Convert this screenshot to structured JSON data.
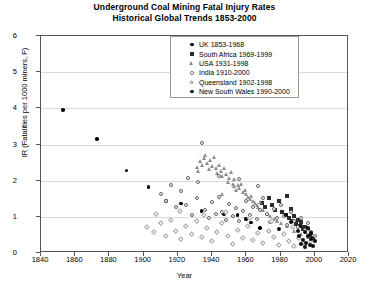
{
  "chart_data": {
    "type": "scatter",
    "title": "Underground Coal Mining Fatal Injury Rates",
    "subtitle": "Historical Global Trends 1853-2000",
    "xlabel": "Year",
    "ylabel": "IR (Fatalities per 1000 miners, F)",
    "xlim": [
      1840,
      2020
    ],
    "ylim": [
      0,
      6
    ],
    "xticks": [
      1840,
      1860,
      1880,
      1900,
      1920,
      1940,
      1960,
      1980,
      2000,
      2020
    ],
    "yticks": [
      0,
      1,
      2,
      3,
      4,
      5,
      6
    ],
    "grid": "horizontal",
    "legend_position": "top-center",
    "series": [
      {
        "name": "UK 1853-1968",
        "marker": "filled-circle",
        "marker_class": "uk",
        "color": "#000000",
        "points": [
          [
            1853,
            3.95
          ],
          [
            1873,
            3.15
          ],
          [
            1890,
            2.27
          ],
          [
            1903,
            1.82
          ],
          [
            1913,
            1.43
          ],
          [
            1922,
            1.36
          ],
          [
            1934,
            1.16
          ],
          [
            1947,
            1.07
          ],
          [
            1955,
            1.04
          ],
          [
            1960,
            0.93
          ],
          [
            1963,
            0.84
          ],
          [
            1968,
            0.68
          ]
        ]
      },
      {
        "name": "South Africa 1969-1999",
        "marker": "filled-square",
        "marker_class": "sa",
        "color": "#2b2b2b",
        "points": [
          [
            1969,
            1.38
          ],
          [
            1971,
            1.26
          ],
          [
            1973,
            1.52
          ],
          [
            1975,
            1.33
          ],
          [
            1977,
            1.18
          ],
          [
            1979,
            1.44
          ],
          [
            1981,
            1.12
          ],
          [
            1983,
            1.05
          ],
          [
            1984,
            1.58
          ],
          [
            1985,
            0.97
          ],
          [
            1986,
            1.21
          ],
          [
            1987,
            0.88
          ],
          [
            1988,
            1.02
          ],
          [
            1989,
            0.79
          ],
          [
            1990,
            0.92
          ],
          [
            1991,
            0.74
          ],
          [
            1992,
            0.86
          ],
          [
            1993,
            0.66
          ],
          [
            1994,
            0.71
          ],
          [
            1995,
            0.58
          ],
          [
            1996,
            0.63
          ],
          [
            1997,
            0.49
          ],
          [
            1998,
            0.55
          ],
          [
            1999,
            0.42
          ]
        ]
      },
      {
        "name": "USA 1931-1998",
        "marker": "triangle",
        "marker_class": "usa",
        "color": "#8d8d8d",
        "points": [
          [
            1931,
            2.38
          ],
          [
            1932,
            2.26
          ],
          [
            1933,
            2.55
          ],
          [
            1934,
            2.44
          ],
          [
            1935,
            2.62
          ],
          [
            1936,
            2.71
          ],
          [
            1937,
            2.49
          ],
          [
            1938,
            2.32
          ],
          [
            1939,
            2.58
          ],
          [
            1940,
            2.41
          ],
          [
            1941,
            2.66
          ],
          [
            1942,
            2.34
          ],
          [
            1943,
            2.21
          ],
          [
            1944,
            2.44
          ],
          [
            1945,
            2.28
          ],
          [
            1946,
            2.12
          ],
          [
            1947,
            2.36
          ],
          [
            1948,
            2.18
          ],
          [
            1949,
            1.96
          ],
          [
            1950,
            2.08
          ],
          [
            1951,
            2.24
          ],
          [
            1952,
            1.92
          ],
          [
            1953,
            1.86
          ],
          [
            1954,
            1.74
          ],
          [
            1955,
            1.88
          ],
          [
            1956,
            1.79
          ],
          [
            1957,
            1.92
          ],
          [
            1958,
            1.68
          ],
          [
            1959,
            1.74
          ],
          [
            1960,
            1.62
          ],
          [
            1961,
            1.55
          ],
          [
            1962,
            1.48
          ],
          [
            1963,
            1.58
          ],
          [
            1964,
            1.44
          ],
          [
            1965,
            1.38
          ],
          [
            1966,
            1.32
          ],
          [
            1967,
            1.26
          ],
          [
            1968,
            1.42
          ],
          [
            1970,
            1.18
          ],
          [
            1972,
            1.08
          ],
          [
            1974,
            1.02
          ],
          [
            1976,
            0.94
          ],
          [
            1978,
            0.88
          ],
          [
            1980,
            0.82
          ],
          [
            1984,
            0.74
          ],
          [
            1988,
            0.62
          ],
          [
            1992,
            0.52
          ],
          [
            1996,
            0.44
          ],
          [
            1998,
            0.38
          ],
          [
            1953,
            2.05
          ],
          [
            1946,
            1.62
          ]
        ]
      },
      {
        "name": "India 1910-2000",
        "marker": "open-circle",
        "marker_class": "india",
        "color": "#5f5f5f",
        "points": [
          [
            1910,
            1.62
          ],
          [
            1913,
            1.44
          ],
          [
            1916,
            1.88
          ],
          [
            1919,
            1.26
          ],
          [
            1922,
            1.72
          ],
          [
            1925,
            1.34
          ],
          [
            1928,
            1.06
          ],
          [
            1931,
            1.52
          ],
          [
            1934,
            3.05
          ],
          [
            1936,
            1.18
          ],
          [
            1938,
            0.96
          ],
          [
            1940,
            1.42
          ],
          [
            1942,
            1.08
          ],
          [
            1944,
            1.56
          ],
          [
            1946,
            1.14
          ],
          [
            1948,
            0.92
          ],
          [
            1950,
            1.36
          ],
          [
            1952,
            1.02
          ],
          [
            1954,
            1.24
          ],
          [
            1956,
            0.88
          ],
          [
            1958,
            1.16
          ],
          [
            1960,
            1.44
          ],
          [
            1962,
            1.06
          ],
          [
            1964,
            1.28
          ],
          [
            1966,
            0.94
          ],
          [
            1968,
            1.18
          ],
          [
            1970,
            1.52
          ],
          [
            1972,
            1.08
          ],
          [
            1974,
            0.86
          ],
          [
            1976,
            1.22
          ],
          [
            1978,
            0.96
          ],
          [
            1980,
            1.34
          ],
          [
            1982,
            1.02
          ],
          [
            1984,
            0.78
          ],
          [
            1986,
            1.12
          ],
          [
            1988,
            0.88
          ],
          [
            1990,
            0.72
          ],
          [
            1992,
            0.96
          ],
          [
            1994,
            0.64
          ],
          [
            1996,
            0.82
          ],
          [
            1998,
            0.58
          ],
          [
            2000,
            0.46
          ],
          [
            1926,
            2.08
          ],
          [
            1932,
            1.96
          ],
          [
            1944,
            2.12
          ],
          [
            1956,
            2.04
          ],
          [
            1967,
            1.86
          ]
        ]
      },
      {
        "name": "Queensland 1902-1998",
        "marker": "open-diamond",
        "marker_class": "qld",
        "color": "#a5a5a5",
        "points": [
          [
            1902,
            0.72
          ],
          [
            1906,
            0.58
          ],
          [
            1910,
            0.84
          ],
          [
            1913,
            0.46
          ],
          [
            1916,
            0.92
          ],
          [
            1919,
            0.62
          ],
          [
            1922,
            0.38
          ],
          [
            1925,
            0.76
          ],
          [
            1928,
            0.52
          ],
          [
            1931,
            0.88
          ],
          [
            1934,
            0.44
          ],
          [
            1937,
            0.68
          ],
          [
            1940,
            0.34
          ],
          [
            1943,
            0.58
          ],
          [
            1946,
            0.82
          ],
          [
            1949,
            0.48
          ],
          [
            1952,
            0.26
          ],
          [
            1955,
            0.64
          ],
          [
            1958,
            0.42
          ],
          [
            1961,
            0.74
          ],
          [
            1964,
            0.36
          ],
          [
            1967,
            0.56
          ],
          [
            1970,
            0.28
          ],
          [
            1973,
            0.62
          ],
          [
            1976,
            0.44
          ],
          [
            1979,
            0.22
          ],
          [
            1982,
            0.52
          ],
          [
            1985,
            0.34
          ],
          [
            1988,
            0.18
          ],
          [
            1991,
            0.42
          ],
          [
            1994,
            0.26
          ],
          [
            1998,
            0.32
          ],
          [
            1907,
            1.08
          ],
          [
            1921,
            1.16
          ],
          [
            1935,
            1.04
          ],
          [
            1948,
            1.12
          ],
          [
            1962,
            0.98
          ],
          [
            1975,
            0.88
          ],
          [
            1987,
            0.72
          ],
          [
            1996,
            0.58
          ]
        ]
      },
      {
        "name": "New South Wales 1990-2000",
        "marker": "filled-circle-small",
        "marker_class": "nsw",
        "color": "#0d0d0d",
        "points": [
          [
            1990,
            0.62
          ],
          [
            1991,
            0.48
          ],
          [
            1992,
            0.74
          ],
          [
            1993,
            0.36
          ],
          [
            1994,
            0.58
          ],
          [
            1995,
            0.28
          ],
          [
            1996,
            0.46
          ],
          [
            1997,
            0.22
          ],
          [
            1998,
            0.38
          ],
          [
            1999,
            0.18
          ],
          [
            2000,
            0.32
          ],
          [
            1992,
            0.26
          ],
          [
            1994,
            0.16
          ],
          [
            1996,
            0.68
          ],
          [
            1998,
            0.54
          ],
          [
            1986,
            0.86
          ],
          [
            1983,
            1.04
          ],
          [
            1979,
            0.66
          ]
        ]
      }
    ]
  }
}
